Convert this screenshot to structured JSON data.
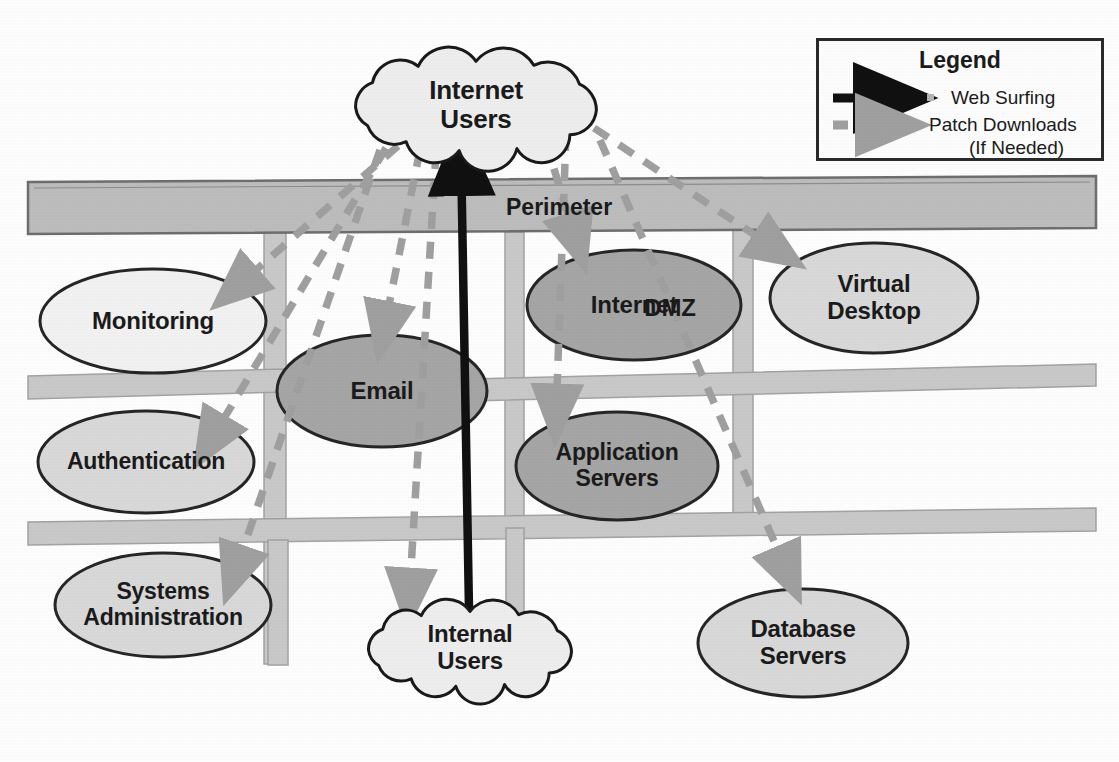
{
  "diagram": {
    "perimeter_label": "Perimeter",
    "colors": {
      "node_fill_light": "#f2f2f2",
      "node_fill_mid": "#d9d9d9",
      "node_fill_dark": "#a6a6a6",
      "node_stroke": "#262626",
      "rail_fill": "#c9c9c9",
      "rail_stroke": "#9a9a9a",
      "perimeter_fill": "#bdbdbd",
      "perimeter_stroke": "#6e6e6e",
      "cloud_fill": "#eeeeee",
      "cloud_stroke": "#1a1a1a",
      "web_surfing_arrow": "#111111",
      "patch_download_arrow": "#a0a0a0",
      "text": "#1b1b1b"
    },
    "clouds": [
      {
        "id": "internet-users",
        "label_line1": "Internet",
        "label_line2": "Users",
        "cx": 476,
        "cy": 105,
        "rx": 140,
        "ry": 62,
        "font_size": 26
      },
      {
        "id": "internal-users",
        "label_line1": "Internal",
        "label_line2": "Users",
        "cx": 470,
        "cy": 648,
        "rx": 118,
        "ry": 52,
        "font_size": 24
      }
    ],
    "nodes": [
      {
        "id": "monitoring",
        "label_line1": "Monitoring",
        "label_line2": "",
        "cx": 153,
        "cy": 321,
        "rx": 113,
        "ry": 52,
        "fill": "light",
        "font_size": 24
      },
      {
        "id": "authentication",
        "label_line1": "Authentication",
        "label_line2": "",
        "cx": 146,
        "cy": 462,
        "rx": 108,
        "ry": 51,
        "fill": "mid",
        "font_size": 23
      },
      {
        "id": "systems-administration",
        "label_line1": "Systems",
        "label_line2": "Administration",
        "cx": 163,
        "cy": 605,
        "rx": 108,
        "ry": 52,
        "fill": "mid",
        "font_size": 23
      },
      {
        "id": "email",
        "label_line1": "Email",
        "label_line2": "",
        "cx": 382,
        "cy": 391,
        "rx": 105,
        "ry": 56,
        "fill": "dark",
        "font_size": 24
      },
      {
        "id": "internet-dmz",
        "label_line1": "Internet",
        "label_line2": "",
        "cx": 634,
        "cy": 305,
        "rx": 107,
        "ry": 55,
        "fill": "dark",
        "font_size": 24
      },
      {
        "id": "application-servers",
        "label_line1": "Application",
        "label_line2": "Servers",
        "cx": 617,
        "cy": 466,
        "rx": 101,
        "ry": 54,
        "fill": "dark",
        "font_size": 23
      },
      {
        "id": "virtual-desktop",
        "label_line1": "Virtual",
        "label_line2": "Desktop",
        "cx": 874,
        "cy": 298,
        "rx": 104,
        "ry": 55,
        "fill": "mid",
        "font_size": 24
      },
      {
        "id": "database-servers",
        "label_line1": "Database",
        "label_line2": "Servers",
        "cx": 803,
        "cy": 643,
        "rx": 105,
        "ry": 54,
        "fill": "mid",
        "font_size": 24
      }
    ],
    "zone_label": {
      "id": "dmz-label",
      "text": "DMZ",
      "x": 670,
      "y": 308,
      "font_size": 24
    },
    "legend": {
      "title": "Legend",
      "rows": [
        {
          "id": "web-surfing",
          "label": "Web Surfing",
          "style": "solid"
        },
        {
          "id": "patch-downloads",
          "label": "Patch Downloads",
          "style": "dashed"
        },
        {
          "id": "patch-downloads-note",
          "label": "(If Needed)",
          "style": "none"
        }
      ]
    },
    "flows": [
      {
        "id": "flow-web-surfing-internal-to-internet",
        "kind": "solid",
        "from": "internal-users",
        "to": "internet-users"
      },
      {
        "id": "flow-patch-internet-to-monitoring",
        "kind": "dashed",
        "from": "internet-users",
        "to": "monitoring"
      },
      {
        "id": "flow-patch-internet-to-authentication",
        "kind": "dashed",
        "from": "internet-users",
        "to": "authentication"
      },
      {
        "id": "flow-patch-internet-to-systems-administration",
        "kind": "dashed",
        "from": "internet-users",
        "to": "systems-administration"
      },
      {
        "id": "flow-patch-internet-to-email",
        "kind": "dashed",
        "from": "internet-users",
        "to": "email"
      },
      {
        "id": "flow-patch-internet-to-internal-users",
        "kind": "dashed",
        "from": "internet-users",
        "to": "internal-users"
      },
      {
        "id": "flow-patch-internet-to-internet-dmz",
        "kind": "dashed",
        "from": "internet-users",
        "to": "internet-dmz"
      },
      {
        "id": "flow-patch-internet-to-application-servers",
        "kind": "dashed",
        "from": "internet-users",
        "to": "application-servers"
      },
      {
        "id": "flow-patch-internet-to-virtual-desktop",
        "kind": "dashed",
        "from": "internet-users",
        "to": "virtual-desktop"
      },
      {
        "id": "flow-patch-internet-to-database-servers",
        "kind": "dashed",
        "from": "internet-users",
        "to": "database-servers"
      }
    ]
  }
}
